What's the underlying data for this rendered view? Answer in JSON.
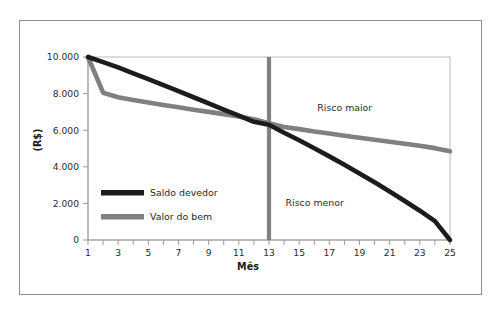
{
  "chart_data": {
    "type": "line",
    "title": "",
    "xlabel": "Mês",
    "ylabel": "(R$)",
    "xlim": [
      1,
      25
    ],
    "ylim": [
      0,
      10000
    ],
    "grid": false,
    "legend_position": "inside-left-lower",
    "y_ticks": [
      0,
      2000,
      4000,
      6000,
      8000,
      10000
    ],
    "y_tick_labels": [
      "0",
      "2.000",
      "4.000",
      "6.000",
      "8.000",
      "10.000"
    ],
    "x_ticks": [
      1,
      2,
      3,
      4,
      5,
      6,
      7,
      8,
      9,
      10,
      11,
      12,
      13,
      14,
      15,
      16,
      17,
      18,
      19,
      20,
      21,
      22,
      23,
      24,
      25
    ],
    "x_tick_labels": [
      "1",
      "",
      "3",
      "",
      "5",
      "",
      "7",
      "",
      "9",
      "",
      "11",
      "",
      "13",
      "",
      "15",
      "",
      "17",
      "",
      "19",
      "",
      "21",
      "",
      "23",
      "",
      "25"
    ],
    "x": [
      1,
      2,
      3,
      4,
      5,
      6,
      7,
      8,
      9,
      10,
      11,
      12,
      13,
      14,
      15,
      16,
      17,
      18,
      19,
      20,
      21,
      22,
      23,
      24,
      25
    ],
    "series": [
      {
        "name": "Saldo devedor",
        "color": "#1c1c1c",
        "values": [
          10000,
          9720,
          9430,
          9110,
          8790,
          8460,
          8130,
          7800,
          7470,
          7130,
          6790,
          6460,
          6300,
          5860,
          5450,
          5010,
          4570,
          4110,
          3640,
          3150,
          2650,
          2130,
          1600,
          1030,
          0
        ]
      },
      {
        "name": "Valor do bem",
        "color": "#808080",
        "values": [
          10000,
          8050,
          7800,
          7650,
          7510,
          7380,
          7250,
          7120,
          7000,
          6880,
          6750,
          6600,
          6380,
          6180,
          6060,
          5930,
          5820,
          5700,
          5590,
          5480,
          5370,
          5260,
          5150,
          5020,
          4850
        ]
      }
    ],
    "reference_line": {
      "name": "divisor-mes-13",
      "x": 13,
      "color": "#808080",
      "label": "13"
    },
    "annotations": [
      {
        "name": "risco-maior",
        "text": "Risco maior",
        "x": 16.2,
        "y": 7050
      },
      {
        "name": "risco-menor",
        "text": "Risco menor",
        "x": 14.1,
        "y": 1850
      }
    ]
  },
  "legend": {
    "items": [
      {
        "label": "Saldo devedor",
        "color": "#1c1c1c"
      },
      {
        "label": "Valor do bem",
        "color": "#808080"
      }
    ]
  }
}
